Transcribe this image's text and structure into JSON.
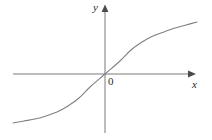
{
  "figure": {
    "background_color": "#ffffff",
    "width": 212,
    "height": 140,
    "axis_color": "#7a7a7a",
    "curve_color": "#808080",
    "text_color": "#2b2b2b"
  },
  "labels": {
    "y_axis": "y",
    "x_axis": "x",
    "origin": "0"
  },
  "chart_data": {
    "type": "line",
    "title": "",
    "subtitle": "",
    "xlabel": "x",
    "ylabel": "y",
    "origin_label": "0",
    "grid": false,
    "legend": "none",
    "axes": {
      "x_axis_pixel_y": 74,
      "y_axis_pixel_x": 105,
      "x_axis_from_pixel_x": 13,
      "x_axis_to_pixel_x": 196,
      "y_axis_from_pixel_y": 8,
      "y_axis_to_pixel_y": 133,
      "x_arrow": "right",
      "y_arrow": "up",
      "ticks": [],
      "tick_labels": [],
      "xlim": [
        -3.2,
        3.2
      ],
      "ylim": [
        -1.35,
        1.35
      ]
    },
    "series": [
      {
        "name": "sigmoid-curve",
        "description": "odd, monotonically increasing S-shaped curve through the origin, flattening toward horizontal asymptotes",
        "color": "#808080",
        "x": [
          -3.2,
          -2.8,
          -2.4,
          -2.0,
          -1.6,
          -1.2,
          -0.8,
          -0.4,
          0.0,
          0.4,
          0.8,
          1.2,
          1.6,
          2.0,
          2.4,
          2.8,
          3.2
        ],
        "y": [
          -1.09,
          -1.06,
          -1.01,
          -0.95,
          -0.87,
          -0.75,
          -0.58,
          -0.33,
          0.0,
          0.33,
          0.58,
          0.75,
          0.87,
          0.95,
          1.01,
          1.06,
          1.09
        ],
        "pixel_points": [
          [
            13,
            123
          ],
          [
            24,
            121
          ],
          [
            35,
            119
          ],
          [
            46,
            116
          ],
          [
            57,
            112
          ],
          [
            68,
            106
          ],
          [
            79,
            98
          ],
          [
            90,
            87
          ],
          [
            105,
            74
          ],
          [
            120,
            61
          ],
          [
            131,
            50
          ],
          [
            142,
            42
          ],
          [
            153,
            36
          ],
          [
            164,
            32
          ],
          [
            175,
            28
          ],
          [
            186,
            25
          ],
          [
            197,
            22
          ]
        ]
      }
    ]
  }
}
